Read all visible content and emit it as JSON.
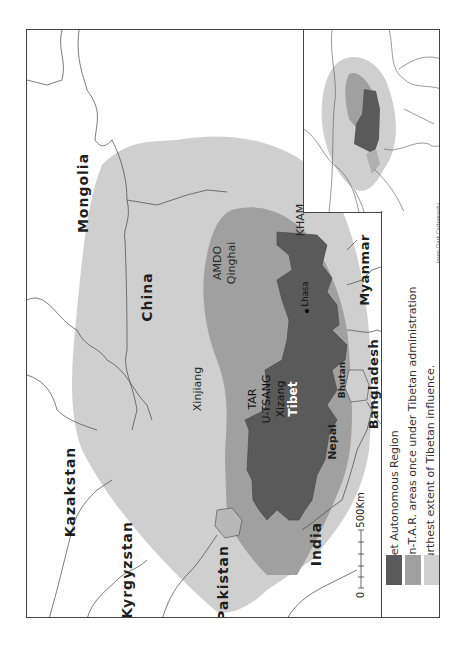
{
  "map": {
    "orientation": "rotated 90 degrees counter-clockwise",
    "labels": {
      "countries": {
        "mongolia": "Mongolia",
        "china": "China",
        "kazakstan": "Kazakstan",
        "kyrgyzstan": "Kyrgyzstan",
        "pakistan": "Pakistan",
        "india": "India",
        "nepal": "Nepal",
        "bhutan": "Bhutan",
        "bangladesh": "Bangladesh",
        "myanmar": "Myanmar"
      },
      "regions": {
        "amdo": "AMDO",
        "qinghai": "Qinghai",
        "kham": "KHAM",
        "xinjiang": "Xinjiang",
        "tar": "TAR",
        "u_tsang": "U-TSANG",
        "xizang": "Xizang",
        "tibet": "Tibet"
      },
      "cities": {
        "lhasa": "Lhasa"
      }
    },
    "scale_bar": {
      "start": "0",
      "end": "500Km"
    },
    "colors": {
      "tar": "#5a5a5a",
      "non_tar": "#a0a0a0",
      "influence": "#cfcfcf",
      "border": "#444444"
    }
  },
  "legend": {
    "items": [
      {
        "label": "Tibet Autonomous Region",
        "color": "#5a5a5a"
      },
      {
        "label": "Non-T.A.R. areas once under Tibetan administration",
        "color": "#a0a0a0"
      },
      {
        "label": "Furthest extent of Tibetan influence.",
        "color": "#cfcfcf"
      }
    ]
  },
  "credit": "Jason Clark Cartography"
}
